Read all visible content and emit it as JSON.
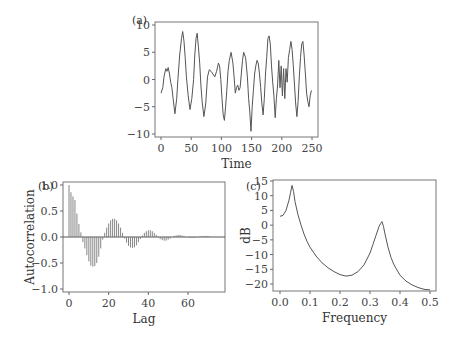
{
  "chart_data": [
    {
      "panel": "(a)",
      "type": "line",
      "title": "",
      "xlabel": "Time",
      "ylabel": "",
      "xlim": [
        0,
        250
      ],
      "ylim": [
        -10,
        10
      ],
      "xticks": [
        0,
        50,
        100,
        150,
        200,
        250
      ],
      "yticks": [
        10,
        5,
        0,
        -5,
        -10
      ],
      "grid": false,
      "x": [
        0,
        3,
        5,
        8,
        10,
        12,
        14,
        16,
        18,
        20,
        23,
        26,
        28,
        31,
        34,
        36,
        38,
        40,
        42,
        45,
        48,
        51,
        54,
        56,
        58,
        60,
        62,
        64,
        66,
        68,
        71,
        74,
        77,
        80,
        83,
        86,
        89,
        92,
        95,
        97,
        99,
        101,
        103,
        105,
        107,
        109,
        111,
        113,
        116,
        119,
        121,
        123,
        125,
        127,
        129,
        131,
        133,
        135,
        137,
        140,
        143,
        145,
        147,
        149,
        151,
        153,
        155,
        157,
        159,
        161,
        163,
        165,
        167,
        169,
        171,
        173,
        175,
        177,
        179,
        181,
        183,
        185,
        187,
        189,
        191,
        193,
        195,
        197,
        199,
        201,
        203,
        205,
        207,
        209,
        211,
        213,
        215,
        217,
        219,
        221,
        223,
        225,
        227,
        229,
        231,
        233,
        235,
        237,
        239,
        241,
        243,
        245,
        247,
        249
      ],
      "values": [
        -2.5,
        -1.5,
        0.5,
        2.0,
        1.5,
        2.2,
        1.0,
        -0.5,
        -1.5,
        -3.5,
        -6.3,
        -3.5,
        0,
        4.5,
        7.5,
        8.8,
        7.0,
        4.0,
        0.5,
        -3.0,
        -5.5,
        -3.5,
        0,
        4.5,
        7.5,
        8.5,
        6.0,
        3.0,
        -1.0,
        -4.0,
        -6.8,
        -4.5,
        0.5,
        1.8,
        1.5,
        1.0,
        0.5,
        1.5,
        3.0,
        2.5,
        0,
        -3.5,
        -6.5,
        -7.5,
        -5.0,
        -2.0,
        1.5,
        3.5,
        5.0,
        3.0,
        0.5,
        -2.5,
        -1.5,
        -1.0,
        -2.0,
        -1.5,
        1.0,
        3.5,
        5.0,
        4.0,
        0.5,
        -3.5,
        -6.0,
        -9.5,
        -5.0,
        -2.0,
        1.0,
        2.5,
        3.5,
        3.0,
        1.0,
        -1.5,
        -4.5,
        -6.5,
        -3.5,
        1.0,
        4.0,
        7.5,
        8.0,
        6.5,
        2.5,
        -0.5,
        -3.0,
        -7.0,
        -3.5,
        -1.0,
        3.5,
        -1.5,
        2.5,
        -3.0,
        2.0,
        -3.5,
        2.0,
        -0.5,
        4.0,
        5.5,
        7.0,
        5.5,
        2.5,
        -1.0,
        -4.5,
        -6.8,
        -4.0,
        0.5,
        4.0,
        6.5,
        7.0,
        4.5,
        1.0,
        -2.5,
        -4.0,
        -5.0,
        -3.0,
        -2.0
      ]
    },
    {
      "panel": "(b)",
      "type": "bar",
      "title": "",
      "xlabel": "Lag",
      "ylabel": "Autocorrelation",
      "xlim": [
        -2,
        78
      ],
      "ylim": [
        -1.1,
        1.1
      ],
      "xticks": [
        0,
        20,
        40,
        60
      ],
      "yticks": [
        1.0,
        0.5,
        0.0,
        -0.5,
        -1.0
      ],
      "grid": false,
      "x": [
        0,
        1,
        2,
        3,
        4,
        5,
        6,
        7,
        8,
        9,
        10,
        11,
        12,
        13,
        14,
        15,
        16,
        17,
        18,
        19,
        20,
        21,
        22,
        23,
        24,
        25,
        26,
        27,
        28,
        29,
        30,
        31,
        32,
        33,
        34,
        35,
        36,
        37,
        38,
        39,
        40,
        41,
        42,
        43,
        44,
        45,
        46,
        47,
        48,
        49,
        50,
        51,
        52,
        53,
        54,
        55,
        56,
        57,
        58,
        59,
        60,
        61,
        62,
        63,
        64,
        65,
        66,
        67,
        68,
        69,
        70,
        71,
        72,
        73,
        74,
        75
      ],
      "values": [
        1.0,
        0.86,
        0.78,
        0.71,
        0.45,
        0.25,
        0.09,
        -0.1,
        -0.22,
        -0.35,
        -0.47,
        -0.55,
        -0.57,
        -0.56,
        -0.5,
        -0.38,
        -0.22,
        -0.05,
        0.08,
        0.18,
        0.26,
        0.32,
        0.35,
        0.35,
        0.32,
        0.26,
        0.18,
        0.08,
        -0.03,
        -0.11,
        -0.17,
        -0.2,
        -0.21,
        -0.2,
        -0.16,
        -0.1,
        -0.04,
        0.03,
        0.08,
        0.11,
        0.13,
        0.13,
        0.11,
        0.08,
        0.04,
        -0.01,
        -0.04,
        -0.06,
        -0.07,
        -0.07,
        -0.05,
        -0.03,
        0.0,
        0.02,
        0.03,
        0.04,
        0.04,
        0.03,
        0.02,
        0.0,
        -0.01,
        -0.02,
        -0.02,
        -0.02,
        -0.01,
        0.0,
        0.01,
        0.02,
        0.02,
        0.02,
        0.02,
        0.01,
        0.0,
        0.0,
        0.0,
        0.0
      ]
    },
    {
      "panel": "(c)",
      "type": "line",
      "title": "",
      "xlabel": "Frequency",
      "ylabel": "dB",
      "xlim": [
        -0.01,
        0.51
      ],
      "ylim": [
        -23,
        15
      ],
      "xticks": [
        0.0,
        0.1,
        0.2,
        0.3,
        0.4,
        0.5
      ],
      "yticks": [
        15,
        10,
        5,
        0,
        -5,
        -10,
        -15,
        -20
      ],
      "grid": false,
      "x": [
        0.0,
        0.01,
        0.02,
        0.03,
        0.035,
        0.04,
        0.045,
        0.05,
        0.06,
        0.07,
        0.08,
        0.09,
        0.1,
        0.12,
        0.14,
        0.16,
        0.18,
        0.2,
        0.22,
        0.24,
        0.26,
        0.28,
        0.3,
        0.31,
        0.32,
        0.33,
        0.335,
        0.34,
        0.345,
        0.35,
        0.36,
        0.37,
        0.38,
        0.4,
        0.42,
        0.44,
        0.46,
        0.48,
        0.5
      ],
      "values": [
        3.0,
        3.3,
        5.0,
        8.5,
        11.0,
        13.5,
        11.5,
        8.0,
        3.5,
        0.0,
        -3.0,
        -5.5,
        -7.5,
        -10.5,
        -12.8,
        -14.5,
        -15.8,
        -16.8,
        -17.3,
        -17.0,
        -15.8,
        -13.5,
        -9.5,
        -6.5,
        -3.5,
        -0.5,
        0.5,
        1.2,
        -0.5,
        -3.0,
        -7.5,
        -11.0,
        -13.5,
        -17.0,
        -19.0,
        -20.3,
        -21.2,
        -21.8,
        -22.0
      ]
    }
  ]
}
